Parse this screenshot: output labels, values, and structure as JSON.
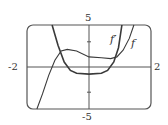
{
  "chart_data": {
    "type": "line",
    "title": "",
    "xlabel": "",
    "ylabel": "",
    "xlim": [
      -2,
      2
    ],
    "ylim": [
      -5,
      5
    ],
    "grid": false,
    "frame": "rounded-rectangle viewing window",
    "tick_labels": {
      "x_left": "-2",
      "x_right": "2",
      "y_top": "5",
      "y_bottom": "-5"
    },
    "y_ticks": [
      -3,
      3
    ],
    "series": [
      {
        "name": "f",
        "label": "f",
        "points": [
          [
            -1.68,
            -5
          ],
          [
            -1.5,
            -3.2
          ],
          [
            -1.3,
            -1.0
          ],
          [
            -1.1,
            0.8
          ],
          [
            -0.9,
            1.9
          ],
          [
            -0.7,
            2.1
          ],
          [
            -0.4,
            1.9
          ],
          [
            0,
            1.2
          ],
          [
            0.4,
            1.1
          ],
          [
            0.7,
            1.0
          ],
          [
            0.9,
            1.2
          ],
          [
            1.1,
            2.0
          ],
          [
            1.3,
            3.4
          ],
          [
            1.45,
            5
          ]
        ]
      },
      {
        "name": "f'",
        "label": "f′",
        "points": [
          [
            -1.19,
            5
          ],
          [
            -1.0,
            2.6
          ],
          [
            -0.8,
            0.6
          ],
          [
            -0.6,
            -0.4
          ],
          [
            -0.4,
            -0.75
          ],
          [
            0,
            -0.85
          ],
          [
            0.4,
            -0.75
          ],
          [
            0.6,
            -0.4
          ],
          [
            0.8,
            0.6
          ],
          [
            0.95,
            2.3
          ],
          [
            1.06,
            5
          ]
        ]
      }
    ]
  },
  "style": {
    "stroke": "#3a3a3a",
    "frame": "#555555"
  }
}
